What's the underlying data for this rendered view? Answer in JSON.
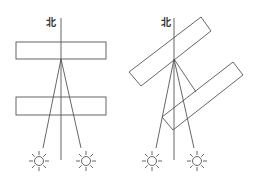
{
  "diagram": {
    "colors": {
      "line": "#555555",
      "background": "#ffffff",
      "text": "#333333"
    },
    "left": {
      "north_label": "北",
      "north_line": {
        "x": 61,
        "y1": 18,
        "y2": 160
      },
      "building_top": {
        "x": 16,
        "y": 42,
        "w": 90,
        "h": 17
      },
      "building_bottom": {
        "x": 16,
        "y": 97,
        "w": 90,
        "h": 18
      },
      "apex": {
        "x": 61,
        "y": 59
      },
      "suns": [
        {
          "x": 39,
          "y": 161
        },
        {
          "x": 86,
          "y": 161
        }
      ]
    },
    "right": {
      "north_label": "北",
      "north_line": {
        "x": 174,
        "y1": 18,
        "y2": 160
      },
      "building_top": [
        [
          129,
          72
        ],
        [
          201,
          17
        ],
        [
          211,
          31
        ],
        [
          141,
          86
        ]
      ],
      "building_bottom": [
        [
          162,
          117
        ],
        [
          233,
          62
        ],
        [
          243,
          75
        ],
        [
          173,
          130
        ]
      ],
      "apex": {
        "x": 174,
        "y": 59
      },
      "suns": [
        {
          "x": 152,
          "y": 161
        },
        {
          "x": 197,
          "y": 161
        }
      ]
    }
  }
}
